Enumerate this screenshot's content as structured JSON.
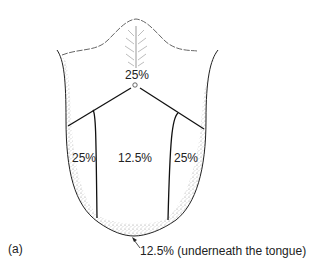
{
  "figure": {
    "panel_label": "(a)",
    "subject": "tongue",
    "regions": [
      {
        "id": "base",
        "label": "25%"
      },
      {
        "id": "left-side",
        "label": "25%"
      },
      {
        "id": "center",
        "label": "12.5%"
      },
      {
        "id": "right-side",
        "label": "25%"
      }
    ],
    "underside_label": "12.5% (underneath the tongue)"
  },
  "colors": {
    "outline": "#222222",
    "stipple": "#9a9a9a",
    "papillae": "#bdbdbd"
  }
}
